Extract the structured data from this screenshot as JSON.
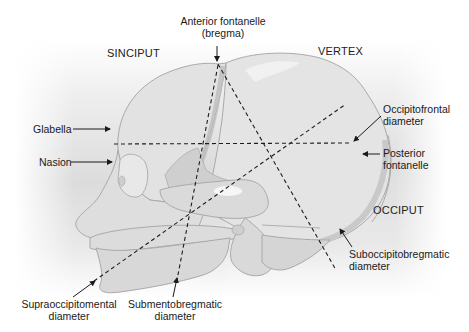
{
  "diagram": {
    "regions": {
      "sinciput": "SINCIPUT",
      "vertex": "VERTEX",
      "occiput": "OCCIPUT"
    },
    "landmarks": {
      "anterior_fontanelle_line1": "Anterior fontanelle",
      "anterior_fontanelle_line2": "(bregma)",
      "glabella": "Glabella",
      "nasion": "Nasion",
      "posterior_fontanelle_line1": "Posterior",
      "posterior_fontanelle_line2": "fontanelle"
    },
    "diameters": {
      "occipitofrontal_line1": "Occipitofrontal",
      "occipitofrontal_line2": "diameter",
      "suboccipitobregmatic_line1": "Suboccipitobregmatic",
      "suboccipitobregmatic_line2": "diameter",
      "supraoccipitomental_line1": "Supraoccipitomental",
      "supraoccipitomental_line2": "diameter",
      "submentobregmatic_line1": "Submentobregmatic",
      "submentobregmatic_line2": "diameter"
    },
    "colors": {
      "bone_fill": "#dcdcdc",
      "bone_outline": "#a8a8a8",
      "suture_fill": "#c4c4c4",
      "dashed_line": "#1e1e1e",
      "label_text": "#1a1a1a"
    }
  }
}
